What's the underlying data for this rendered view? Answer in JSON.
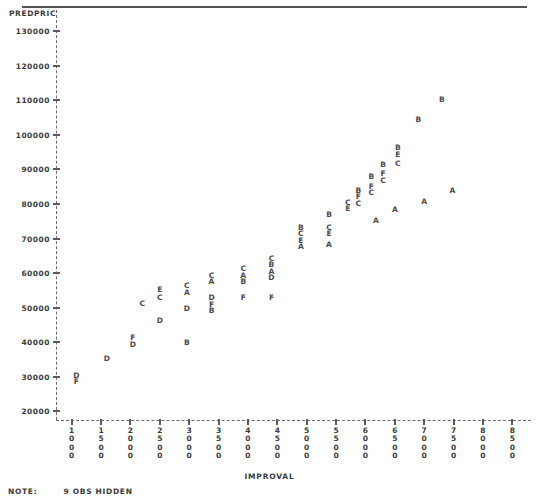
{
  "chart_data": {
    "type": "scatter",
    "title": "",
    "xlabel": "IMPROVAL",
    "ylabel": "PREDPRIC",
    "xlim": [
      750,
      8750
    ],
    "ylim": [
      17500,
      135000
    ],
    "grid": false,
    "legend": "none",
    "marker_style": "letter-coded character plot",
    "xticks": [
      1000,
      1500,
      2000,
      2500,
      3000,
      3500,
      4000,
      4500,
      5000,
      5500,
      6000,
      6500,
      7000,
      7500,
      8000,
      8500
    ],
    "xtick_labels": [
      "1000",
      "1500",
      "2000",
      "2500",
      "3000",
      "3500",
      "4000",
      "4500",
      "5000",
      "5500",
      "6000",
      "6500",
      "7000",
      "7500",
      "8000",
      "8500"
    ],
    "yticks": [
      20000,
      30000,
      40000,
      50000,
      60000,
      70000,
      80000,
      90000,
      100000,
      110000,
      120000,
      130000
    ],
    "ytick_labels": [
      "20000",
      "30000",
      "40000",
      "50000",
      "60000",
      "70000",
      "80000",
      "90000",
      "100000",
      "110000",
      "120000",
      "130000"
    ],
    "points": [
      {
        "label": "D",
        "x": 1080,
        "y": 30500
      },
      {
        "label": "F",
        "x": 1080,
        "y": 28700
      },
      {
        "label": "D",
        "x": 1600,
        "y": 35500
      },
      {
        "label": "F",
        "x": 2040,
        "y": 41500
      },
      {
        "label": "D",
        "x": 2040,
        "y": 39600
      },
      {
        "label": "C",
        "x": 2200,
        "y": 51500
      },
      {
        "label": "E",
        "x": 2500,
        "y": 55500
      },
      {
        "label": "C",
        "x": 2500,
        "y": 53000
      },
      {
        "label": "D",
        "x": 2500,
        "y": 46500
      },
      {
        "label": "C",
        "x": 2960,
        "y": 56500
      },
      {
        "label": "A",
        "x": 2960,
        "y": 54600
      },
      {
        "label": "D",
        "x": 2960,
        "y": 49800
      },
      {
        "label": "B",
        "x": 2960,
        "y": 40200
      },
      {
        "label": "C",
        "x": 3380,
        "y": 59600
      },
      {
        "label": "A",
        "x": 3380,
        "y": 57700
      },
      {
        "label": "D",
        "x": 3380,
        "y": 53000
      },
      {
        "label": "F",
        "x": 3380,
        "y": 51200
      },
      {
        "label": "B",
        "x": 3380,
        "y": 49400
      },
      {
        "label": "C",
        "x": 3920,
        "y": 61500
      },
      {
        "label": "A",
        "x": 3920,
        "y": 59600
      },
      {
        "label": "B",
        "x": 3920,
        "y": 57700
      },
      {
        "label": "F",
        "x": 3920,
        "y": 53000
      },
      {
        "label": "C",
        "x": 4400,
        "y": 64500
      },
      {
        "label": "B",
        "x": 4400,
        "y": 62600
      },
      {
        "label": "A",
        "x": 4400,
        "y": 60700
      },
      {
        "label": "D",
        "x": 4400,
        "y": 58800
      },
      {
        "label": "F",
        "x": 4400,
        "y": 53000
      },
      {
        "label": "B",
        "x": 4900,
        "y": 73500
      },
      {
        "label": "C",
        "x": 4900,
        "y": 71600
      },
      {
        "label": "E",
        "x": 4900,
        "y": 69700
      },
      {
        "label": "A",
        "x": 4900,
        "y": 67800
      },
      {
        "label": "B",
        "x": 5380,
        "y": 77200
      },
      {
        "label": "C",
        "x": 5380,
        "y": 73500
      },
      {
        "label": "E",
        "x": 5380,
        "y": 71600
      },
      {
        "label": "A",
        "x": 5380,
        "y": 68500
      },
      {
        "label": "C",
        "x": 5700,
        "y": 80700
      },
      {
        "label": "E",
        "x": 5700,
        "y": 78800
      },
      {
        "label": "B",
        "x": 5880,
        "y": 84200
      },
      {
        "label": "F",
        "x": 5880,
        "y": 82300
      },
      {
        "label": "C",
        "x": 5880,
        "y": 80400
      },
      {
        "label": "B",
        "x": 6100,
        "y": 88200
      },
      {
        "label": "F",
        "x": 6100,
        "y": 85300
      },
      {
        "label": "C",
        "x": 6100,
        "y": 83400
      },
      {
        "label": "B",
        "x": 6300,
        "y": 91600
      },
      {
        "label": "F",
        "x": 6300,
        "y": 89000
      },
      {
        "label": "C",
        "x": 6300,
        "y": 87000
      },
      {
        "label": "A",
        "x": 6180,
        "y": 75500
      },
      {
        "label": "A",
        "x": 6500,
        "y": 78500
      },
      {
        "label": "B",
        "x": 6550,
        "y": 96500
      },
      {
        "label": "E",
        "x": 6550,
        "y": 94600
      },
      {
        "label": "C",
        "x": 6550,
        "y": 91800
      },
      {
        "label": "B",
        "x": 6900,
        "y": 104500
      },
      {
        "label": "A",
        "x": 7000,
        "y": 80800
      },
      {
        "label": "B",
        "x": 7300,
        "y": 110500
      },
      {
        "label": "A",
        "x": 7480,
        "y": 84000
      }
    ]
  },
  "note": {
    "label": "NOTE:",
    "text": "9 OBS HIDDEN"
  }
}
